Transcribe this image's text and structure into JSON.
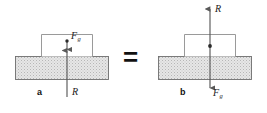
{
  "figure": {
    "type": "physics-free-body-diagram",
    "background_color": "#ffffff",
    "equals_sign": "=",
    "panels": [
      {
        "id": "a",
        "caption": "a",
        "forces": [
          {
            "symbol": "F",
            "subscript": "g",
            "name": "gravitational-force",
            "direction": "down",
            "label": "F_g"
          },
          {
            "symbol": "R",
            "subscript": "",
            "name": "normal-reaction-force",
            "direction": "up",
            "label": "R"
          }
        ]
      },
      {
        "id": "b",
        "caption": "b",
        "forces": [
          {
            "symbol": "R",
            "subscript": "",
            "name": "normal-reaction-force",
            "direction": "up",
            "label": "R"
          },
          {
            "symbol": "F",
            "subscript": "g",
            "name": "gravitational-force",
            "direction": "down",
            "label": "F_g"
          }
        ]
      }
    ],
    "labels": {
      "panel_a_force_gravity_symbol": "F",
      "panel_a_force_gravity_sub": "g",
      "panel_a_force_reaction": "R",
      "panel_a_caption": "a",
      "panel_b_force_reaction": "R",
      "panel_b_force_gravity_symbol": "F",
      "panel_b_force_gravity_sub": "g",
      "panel_b_caption": "b"
    },
    "colors": {
      "slab_fill": "#e3e3e3",
      "slab_stroke": "#6e6e6e",
      "block_fill": "#ffffff",
      "block_stroke": "#8a8a8a",
      "arrow": "#595959",
      "text": "#1a1a1a",
      "equals": "#111111"
    },
    "shapes": {
      "panel_a_slab": {
        "x": 15,
        "y": 56,
        "w": 94,
        "h": 24
      },
      "panel_a_block": {
        "x": 41,
        "y": 34,
        "w": 52,
        "h": 22
      },
      "panel_b_slab": {
        "x": 158,
        "y": 56,
        "w": 94,
        "h": 24
      },
      "panel_b_block": {
        "x": 184,
        "y": 34,
        "w": 52,
        "h": 22
      }
    }
  }
}
